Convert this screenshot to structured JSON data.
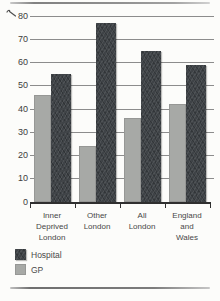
{
  "page": {
    "kind": "scanned textbook bar chart",
    "background": "#fcfcfa"
  },
  "chart_data": {
    "type": "bar",
    "title": "",
    "xlabel": "",
    "ylabel": "",
    "categories": [
      "Inner Deprived London",
      "Other London",
      "All London",
      "England and Wales"
    ],
    "category_lines": [
      [
        "Inner",
        "Deprived",
        "London"
      ],
      [
        "Other",
        "London"
      ],
      [
        "All",
        "London"
      ],
      [
        "England",
        "and",
        "Wales"
      ]
    ],
    "series": [
      {
        "name": "Hospital",
        "color": "#3f4347",
        "texture": "diagonal-hatch",
        "values": [
          55,
          77,
          65,
          59
        ]
      },
      {
        "name": "GP",
        "color": "#a7a9a6",
        "texture": "flat",
        "values": [
          46,
          24,
          36,
          42
        ]
      }
    ],
    "bar_order_within_group": [
      "GP",
      "Hospital"
    ],
    "ylim": [
      0,
      80
    ],
    "yticks": [
      0,
      10,
      20,
      30,
      40,
      50,
      60,
      70,
      80
    ],
    "grid": true,
    "legend_position": "bottom-left",
    "colors": {
      "gridline": "#8c8c8c",
      "axis_line": "#2f2f2f",
      "tick_text": "#3d3d3d",
      "label_text": "#474747"
    }
  },
  "decorations": {
    "top_rule": "horizontal gray rule",
    "bottom_rule": "horizontal gray rule",
    "stray_mark": "small pen squiggle left of the 80 tick"
  }
}
